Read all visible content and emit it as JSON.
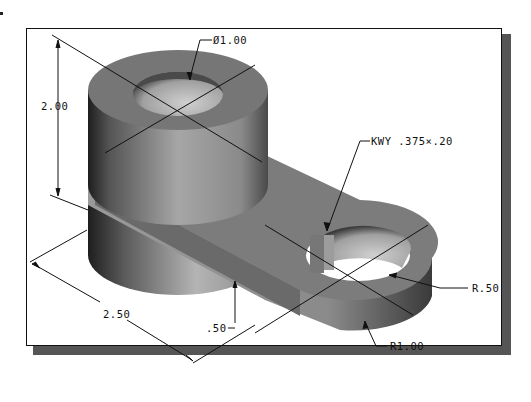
{
  "figure": {
    "type": "isometric-shaded-part-drawing",
    "frame_shadow_color": "#555555",
    "frame_border_color": "#111111",
    "part_colors": {
      "top": "#7a7a7a",
      "side_light": "#a8a8a8",
      "side_dark": "#3a3a3a",
      "hole_inner": "#c8c8c8"
    },
    "dimensions": {
      "boss_diameter": "Ø1.00",
      "height": "2.00",
      "keyway": "KWY .375×.20",
      "hole_radius": "R.50",
      "end_radius": "R1.00",
      "length": "2.50",
      "plate_thickness": ".50"
    }
  }
}
